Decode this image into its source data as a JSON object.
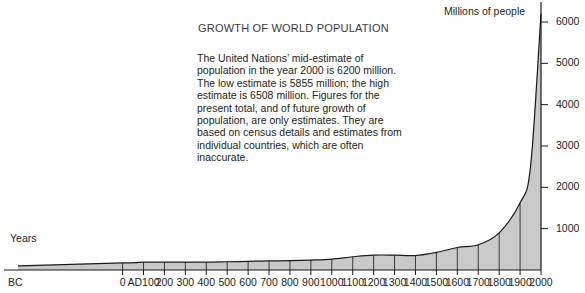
{
  "chart_data": {
    "type": "area",
    "title": "GROWTH OF WORLD POPULATION",
    "xlabel": "Years",
    "ylabel": "Millions of people",
    "xlim": [
      -500,
      2000
    ],
    "ylim": [
      0,
      6400
    ],
    "grid": "vertical-century-lines",
    "legend": "none",
    "x": [
      -500,
      0,
      100,
      200,
      300,
      400,
      500,
      600,
      700,
      800,
      900,
      1000,
      1100,
      1200,
      1300,
      1400,
      1500,
      1600,
      1700,
      1800,
      1900,
      1950,
      2000
    ],
    "values": [
      100,
      170,
      190,
      190,
      190,
      190,
      200,
      210,
      220,
      225,
      240,
      265,
      320,
      360,
      360,
      350,
      425,
      545,
      610,
      900,
      1625,
      2500,
      6200
    ],
    "x_tick_labels": [
      "BC",
      "0",
      "AD100",
      "200",
      "300",
      "400",
      "500",
      "600",
      "700",
      "800",
      "900",
      "1000",
      "1100",
      "1200",
      "1300",
      "1400",
      "1500",
      "1600",
      "1700",
      "1800",
      "1900",
      "2000"
    ],
    "y_tick_labels": [
      "1000",
      "2000",
      "3000",
      "4000",
      "5000",
      "6000"
    ],
    "y_ticks": [
      1000,
      2000,
      3000,
      4000,
      5000,
      6000
    ],
    "annotations": {
      "description": "The United Nations’ mid-estimate of population in the year 2000 is 6200 million. The low estimate is 5855 million; the high estimate is 6508 million. Figures for the present total, and of future growth of population, are only estimates. They are based on census details and estimates from individual countries, which are often inaccurate."
    },
    "colors": {
      "area_fill": "#c9c9c9",
      "curve_line": "#1a1a1a",
      "axis": "#1a1a1a",
      "gridline": "#3a3a3a",
      "text": "#231f20"
    },
    "data_labels": {
      "mid_estimate_2000": 6200,
      "low_estimate_2000": 5855,
      "high_estimate_2000": 6508
    }
  }
}
